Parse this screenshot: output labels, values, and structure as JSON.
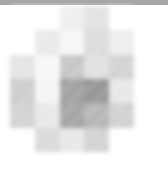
{
  "image": {
    "kind": "pixelated-heatmap-thumbnail",
    "width": 168,
    "height": 169,
    "background_color": "#ffffff"
  },
  "top_bar": {
    "color": "#a6a6a6",
    "height": 5
  },
  "mosaic": {
    "columns": 5,
    "rows": 6,
    "cell_width": 24.8,
    "cell_height": 24.33,
    "origin_x": 10,
    "origin_y": 6,
    "blur_radius": 2.2,
    "palette": {
      "empty": "#ffffff",
      "lightest": "#f2f2f2",
      "light": "#e4e4e4",
      "light_mid": "#d8d8d8",
      "mid": "#cacaca",
      "mid_dark": "#b4b4b4",
      "dark": "#a2a2a2",
      "darkest": "#8d8d8d"
    },
    "grid_colors": [
      [
        "#ffffff",
        "#ffffff",
        "#ededed",
        "#e0e0e0",
        "#ffffff"
      ],
      [
        "#ffffff",
        "#e8e8e8",
        "#f6f6f6",
        "#d9d9d9",
        "#ececec"
      ],
      [
        "#e2e2e2",
        "#f7f7f7",
        "#c2c2c2",
        "#dedede",
        "#cfcfcf"
      ],
      [
        "#c9c9c9",
        "#f4f4f4",
        "#9a9a9a",
        "#8d8d8d",
        "#e6e6e6"
      ],
      [
        "#cfcfcf",
        "#e6e6e6",
        "#9d9d9d",
        "#b0b0b0",
        "#cdcdcd"
      ],
      [
        "#ffffff",
        "#d7d7d7",
        "#e6e6e6",
        "#cfcfcf",
        "#ffffff"
      ]
    ],
    "grid_values": [
      [
        0.0,
        0.0,
        0.07,
        0.12,
        0.0
      ],
      [
        0.0,
        0.09,
        0.04,
        0.15,
        0.08
      ],
      [
        0.11,
        0.03,
        0.24,
        0.13,
        0.19
      ],
      [
        0.21,
        0.04,
        0.4,
        0.45,
        0.1
      ],
      [
        0.19,
        0.1,
        0.39,
        0.31,
        0.2
      ],
      [
        0.0,
        0.16,
        0.1,
        0.19,
        0.0
      ]
    ]
  }
}
